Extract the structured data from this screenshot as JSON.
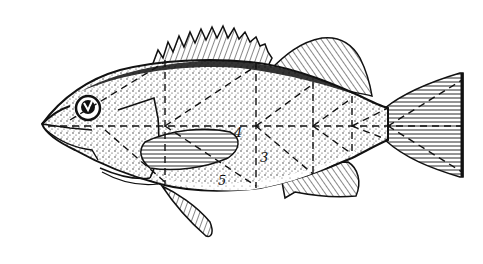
{
  "figure": {
    "background": "#ffffff",
    "ink": "#111111",
    "labels": [
      {
        "id": "label-3",
        "text": "3",
        "x": 260,
        "y": 162
      },
      {
        "id": "label-4",
        "text": "4",
        "x": 234,
        "y": 137
      },
      {
        "id": "label-5",
        "text": "5",
        "x": 218,
        "y": 185
      }
    ]
  }
}
